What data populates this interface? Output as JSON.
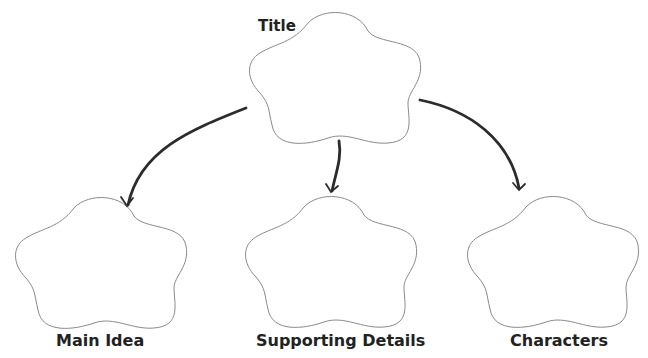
{
  "diagram": {
    "type": "graphic-organizer",
    "root": {
      "label": "Title"
    },
    "children": [
      {
        "label": "Main Idea"
      },
      {
        "label": "Supporting Details"
      },
      {
        "label": "Characters"
      }
    ],
    "colors": {
      "shape_outline": "#8a8a8a",
      "arrow": "#2b2b2b",
      "text": "#222222",
      "background": "#ffffff"
    }
  }
}
